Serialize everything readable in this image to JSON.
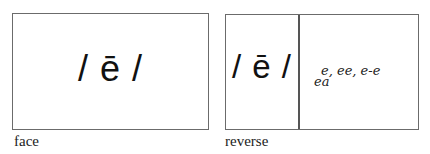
{
  "face": {
    "phoneme": "/ ē /",
    "caption": "face"
  },
  "reverse": {
    "phoneme": "/ ē /",
    "spellings_line1": "e, ee, e-e",
    "spellings_line2": "ea",
    "spellings": [
      "e",
      "ee",
      "e-e",
      "ea"
    ],
    "caption": "reverse"
  },
  "colors": {
    "border": "#6b6b6b",
    "text": "#111111",
    "background": "#ffffff"
  }
}
